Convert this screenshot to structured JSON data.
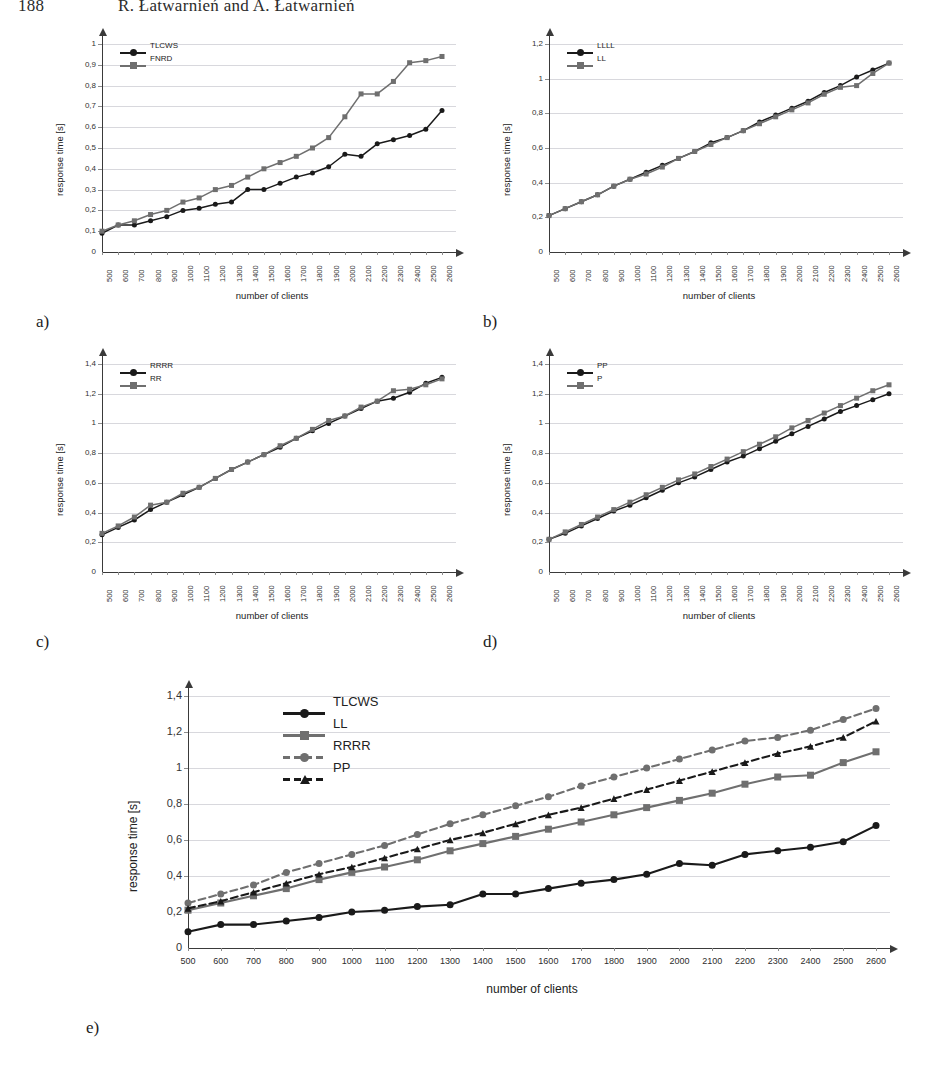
{
  "running_head": {
    "folio": "188",
    "authors": "R. Łatwarnień and A. Łatwarnień"
  },
  "axis_titles": {
    "x": "number of clients",
    "y": "response time [s]"
  },
  "panels": [
    {
      "label": "a)"
    },
    {
      "label": "b)"
    },
    {
      "label": "c)"
    },
    {
      "label": "d)"
    },
    {
      "label": "e)"
    }
  ],
  "colors": {
    "series_black": "#1a1a1a",
    "series_gray": "#6f6f6f",
    "grid": "#d8d8dd",
    "axis": "#3a3a3a",
    "background": "#ffffff"
  },
  "chart_data": [
    {
      "type": "line",
      "panel": "a)",
      "title": "",
      "xlabel": "number of clients",
      "ylabel": "response time [s]",
      "x": [
        500,
        600,
        700,
        800,
        900,
        1000,
        1100,
        1200,
        1300,
        1400,
        1500,
        1600,
        1700,
        1800,
        1900,
        2000,
        2100,
        2200,
        2300,
        2400,
        2500,
        2600
      ],
      "xlim": [
        500,
        2600
      ],
      "ylim": [
        0,
        1
      ],
      "yticks": [
        "0",
        "0,1",
        "0,2",
        "0,3",
        "0,4",
        "0,5",
        "0,6",
        "0,7",
        "0,8",
        "0,9",
        "1"
      ],
      "ytick_values": [
        0,
        0.1,
        0.2,
        0.3,
        0.4,
        0.5,
        0.6,
        0.7,
        0.8,
        0.9,
        1.0
      ],
      "xtick_labels": [
        "500",
        "600",
        "700",
        "800",
        "900",
        "1000",
        "1100",
        "1200",
        "1300",
        "1400",
        "1500",
        "1600",
        "1700",
        "1800",
        "1900",
        "2000",
        "2100",
        "2200",
        "2300",
        "2400",
        "2500",
        "2600"
      ],
      "xtick_orientation": "vertical",
      "grid": true,
      "legend_position": "top-left",
      "series": [
        {
          "name": "TLCWS",
          "color": "#1a1a1a",
          "marker": "circle",
          "dash": "solid",
          "values": [
            0.09,
            0.13,
            0.13,
            0.15,
            0.17,
            0.2,
            0.21,
            0.23,
            0.24,
            0.3,
            0.3,
            0.33,
            0.36,
            0.38,
            0.41,
            0.47,
            0.46,
            0.52,
            0.54,
            0.56,
            0.59,
            0.68
          ]
        },
        {
          "name": "FNRD",
          "color": "#6f6f6f",
          "marker": "square",
          "dash": "solid",
          "values": [
            0.1,
            0.13,
            0.15,
            0.18,
            0.2,
            0.24,
            0.26,
            0.3,
            0.32,
            0.36,
            0.4,
            0.43,
            0.46,
            0.5,
            0.55,
            0.65,
            0.76,
            0.76,
            0.82,
            0.91,
            0.92,
            0.94
          ]
        }
      ]
    },
    {
      "type": "line",
      "panel": "b)",
      "title": "",
      "xlabel": "number of clients",
      "ylabel": "response time [s]",
      "x": [
        500,
        600,
        700,
        800,
        900,
        1000,
        1100,
        1200,
        1300,
        1400,
        1500,
        1600,
        1700,
        1800,
        1900,
        2000,
        2100,
        2200,
        2300,
        2400,
        2500,
        2600
      ],
      "xlim": [
        500,
        2600
      ],
      "ylim": [
        0,
        1.2
      ],
      "yticks": [
        "0",
        "0,2",
        "0,4",
        "0,6",
        "0,8",
        "1",
        "1,2"
      ],
      "ytick_values": [
        0,
        0.2,
        0.4,
        0.6,
        0.8,
        1.0,
        1.2
      ],
      "xtick_labels": [
        "500",
        "600",
        "700",
        "800",
        "900",
        "1000",
        "1100",
        "1200",
        "1300",
        "1400",
        "1500",
        "1600",
        "1700",
        "1800",
        "1900",
        "2000",
        "2100",
        "2200",
        "2300",
        "2400",
        "2500",
        "2600"
      ],
      "xtick_orientation": "vertical",
      "grid": true,
      "legend_position": "top-left",
      "series": [
        {
          "name": "LLLL",
          "color": "#1a1a1a",
          "marker": "circle",
          "dash": "solid",
          "values": [
            0.21,
            0.25,
            0.29,
            0.33,
            0.38,
            0.42,
            0.46,
            0.5,
            0.54,
            0.58,
            0.63,
            0.66,
            0.7,
            0.75,
            0.79,
            0.83,
            0.87,
            0.92,
            0.96,
            1.01,
            1.05,
            1.09
          ]
        },
        {
          "name": "LL",
          "color": "#6f6f6f",
          "marker": "square",
          "dash": "solid",
          "values": [
            0.21,
            0.25,
            0.29,
            0.33,
            0.38,
            0.42,
            0.45,
            0.49,
            0.54,
            0.58,
            0.62,
            0.66,
            0.7,
            0.74,
            0.78,
            0.82,
            0.86,
            0.91,
            0.95,
            0.96,
            1.03,
            1.09
          ]
        }
      ]
    },
    {
      "type": "line",
      "panel": "c)",
      "title": "",
      "xlabel": "number of clients",
      "ylabel": "response time [s]",
      "x": [
        500,
        600,
        700,
        800,
        900,
        1000,
        1100,
        1200,
        1300,
        1400,
        1500,
        1600,
        1700,
        1800,
        1900,
        2000,
        2100,
        2200,
        2300,
        2400,
        2500,
        2600
      ],
      "xlim": [
        500,
        2600
      ],
      "ylim": [
        0,
        1.4
      ],
      "yticks": [
        "0",
        "0,2",
        "0,4",
        "0,6",
        "0,8",
        "1",
        "1,2",
        "1,4"
      ],
      "ytick_values": [
        0,
        0.2,
        0.4,
        0.6,
        0.8,
        1.0,
        1.2,
        1.4
      ],
      "xtick_labels": [
        "500",
        "600",
        "700",
        "800",
        "900",
        "1000",
        "1100",
        "1200",
        "1300",
        "1400",
        "1500",
        "1600",
        "1700",
        "1800",
        "1900",
        "2000",
        "2100",
        "2200",
        "2300",
        "2400",
        "2500",
        "2600"
      ],
      "xtick_orientation": "vertical",
      "grid": true,
      "legend_position": "top-left",
      "series": [
        {
          "name": "RRRR",
          "color": "#1a1a1a",
          "marker": "circle",
          "dash": "solid",
          "values": [
            0.25,
            0.3,
            0.35,
            0.42,
            0.47,
            0.52,
            0.57,
            0.63,
            0.69,
            0.74,
            0.79,
            0.84,
            0.9,
            0.95,
            1.0,
            1.05,
            1.1,
            1.15,
            1.17,
            1.21,
            1.27,
            1.31
          ]
        },
        {
          "name": "RR",
          "color": "#6f6f6f",
          "marker": "square",
          "dash": "solid",
          "values": [
            0.26,
            0.31,
            0.37,
            0.45,
            0.47,
            0.53,
            0.57,
            0.63,
            0.69,
            0.74,
            0.79,
            0.85,
            0.9,
            0.96,
            1.02,
            1.05,
            1.11,
            1.15,
            1.22,
            1.23,
            1.26,
            1.3
          ]
        }
      ]
    },
    {
      "type": "line",
      "panel": "d)",
      "title": "",
      "xlabel": "number of clients",
      "ylabel": "response time [s]",
      "x": [
        500,
        600,
        700,
        800,
        900,
        1000,
        1100,
        1200,
        1300,
        1400,
        1500,
        1600,
        1700,
        1800,
        1900,
        2000,
        2100,
        2200,
        2300,
        2400,
        2500,
        2600
      ],
      "xlim": [
        500,
        2600
      ],
      "ylim": [
        0,
        1.4
      ],
      "yticks": [
        "0",
        "0,2",
        "0,4",
        "0,6",
        "0,8",
        "1",
        "1,2",
        "1,4"
      ],
      "ytick_values": [
        0,
        0.2,
        0.4,
        0.6,
        0.8,
        1.0,
        1.2,
        1.4
      ],
      "xtick_labels": [
        "500",
        "600",
        "700",
        "800",
        "900",
        "1000",
        "1100",
        "1200",
        "1300",
        "1400",
        "1500",
        "1600",
        "1700",
        "1800",
        "1900",
        "2000",
        "2100",
        "2200",
        "2300",
        "2400",
        "2500",
        "2600"
      ],
      "xtick_orientation": "vertical",
      "grid": true,
      "legend_position": "top-left",
      "series": [
        {
          "name": "PP",
          "color": "#1a1a1a",
          "marker": "circle",
          "dash": "solid",
          "values": [
            0.22,
            0.26,
            0.31,
            0.36,
            0.41,
            0.45,
            0.5,
            0.55,
            0.6,
            0.64,
            0.69,
            0.74,
            0.78,
            0.83,
            0.88,
            0.93,
            0.98,
            1.03,
            1.08,
            1.12,
            1.16,
            1.2
          ]
        },
        {
          "name": "P",
          "color": "#6f6f6f",
          "marker": "square",
          "dash": "solid",
          "values": [
            0.22,
            0.27,
            0.32,
            0.37,
            0.42,
            0.47,
            0.52,
            0.57,
            0.62,
            0.66,
            0.71,
            0.76,
            0.81,
            0.86,
            0.91,
            0.97,
            1.02,
            1.07,
            1.12,
            1.17,
            1.22,
            1.26
          ]
        }
      ]
    },
    {
      "type": "line",
      "panel": "e)",
      "title": "",
      "xlabel": "number of clients",
      "ylabel": "response time [s]",
      "x": [
        500,
        600,
        700,
        800,
        900,
        1000,
        1100,
        1200,
        1300,
        1400,
        1500,
        1600,
        1700,
        1800,
        1900,
        2000,
        2100,
        2200,
        2300,
        2400,
        2500,
        2600
      ],
      "xlim": [
        500,
        2600
      ],
      "ylim": [
        0,
        1.4
      ],
      "yticks": [
        "0",
        "0,2",
        "0,4",
        "0,6",
        "0,8",
        "1",
        "1,2",
        "1,4"
      ],
      "ytick_values": [
        0,
        0.2,
        0.4,
        0.6,
        0.8,
        1.0,
        1.2,
        1.4
      ],
      "xtick_labels": [
        "500",
        "600",
        "700",
        "800",
        "900",
        "1000",
        "1100",
        "1200",
        "1300",
        "1400",
        "1500",
        "1600",
        "1700",
        "1800",
        "1900",
        "2000",
        "2100",
        "2200",
        "2300",
        "2400",
        "2500",
        "2600"
      ],
      "xtick_orientation": "horizontal",
      "grid": true,
      "legend_position": "top-left",
      "series": [
        {
          "name": "TLCWS",
          "color": "#1a1a1a",
          "marker": "circle",
          "dash": "solid",
          "values": [
            0.09,
            0.13,
            0.13,
            0.15,
            0.17,
            0.2,
            0.21,
            0.23,
            0.24,
            0.3,
            0.3,
            0.33,
            0.36,
            0.38,
            0.41,
            0.47,
            0.46,
            0.52,
            0.54,
            0.56,
            0.59,
            0.68
          ]
        },
        {
          "name": "LL",
          "color": "#6f6f6f",
          "marker": "square",
          "dash": "solid",
          "values": [
            0.21,
            0.25,
            0.29,
            0.33,
            0.38,
            0.42,
            0.45,
            0.49,
            0.54,
            0.58,
            0.62,
            0.66,
            0.7,
            0.74,
            0.78,
            0.82,
            0.86,
            0.91,
            0.95,
            0.96,
            1.03,
            1.09
          ]
        },
        {
          "name": "RRRR",
          "color": "#6f6f6f",
          "marker": "circle",
          "dash": "dashed",
          "values": [
            0.25,
            0.3,
            0.35,
            0.42,
            0.47,
            0.52,
            0.57,
            0.63,
            0.69,
            0.74,
            0.79,
            0.84,
            0.9,
            0.95,
            1.0,
            1.05,
            1.1,
            1.15,
            1.17,
            1.21,
            1.27,
            1.33
          ]
        },
        {
          "name": "PP",
          "color": "#1a1a1a",
          "marker": "triangle",
          "dash": "dashed",
          "values": [
            0.22,
            0.26,
            0.31,
            0.36,
            0.41,
            0.45,
            0.5,
            0.55,
            0.6,
            0.64,
            0.69,
            0.74,
            0.78,
            0.83,
            0.88,
            0.93,
            0.98,
            1.03,
            1.08,
            1.12,
            1.17,
            1.26
          ]
        }
      ]
    }
  ]
}
